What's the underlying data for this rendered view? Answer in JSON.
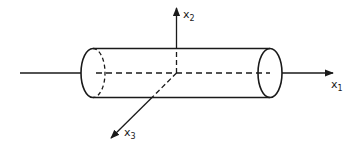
{
  "diagram": {
    "type": "coordinate-system-cylinder",
    "axes": [
      {
        "id": "x1",
        "label": "x",
        "subscript": "1",
        "direction": "right"
      },
      {
        "id": "x2",
        "label": "x",
        "subscript": "2",
        "direction": "up"
      },
      {
        "id": "x3",
        "label": "x",
        "subscript": "3",
        "direction": "down-left"
      }
    ],
    "colors": {
      "stroke": "#1a1a1a",
      "background": "#ffffff"
    }
  }
}
